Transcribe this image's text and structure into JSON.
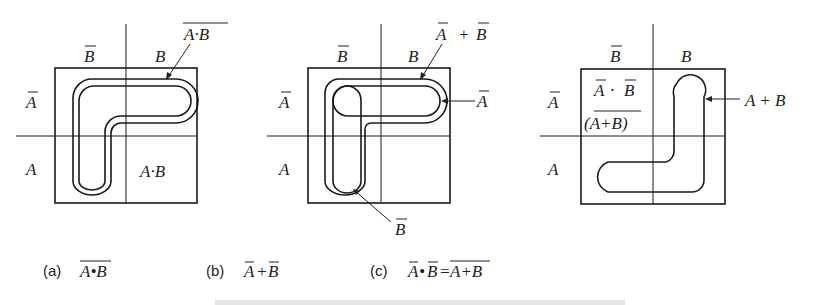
{
  "figure": {
    "panels": [
      {
        "id": "a",
        "col_labels": [
          "B̄",
          "B"
        ],
        "row_labels": [
          "Ā",
          "A"
        ],
        "cell_text": "A·B",
        "callout": "A·B (overbar)",
        "callout_text": "A·B",
        "caption_tag": "(a)",
        "caption_expr": "A•B"
      },
      {
        "id": "b",
        "col_labels": [
          "B̄",
          "B"
        ],
        "row_labels": [
          "Ā",
          "A"
        ],
        "callout_top": "Ā + B̄",
        "callout_top_a": "A",
        "callout_top_op": "+",
        "callout_top_b": "B",
        "callout_right": "A",
        "callout_bottom": "B",
        "caption_tag": "(b)",
        "caption_a": "A",
        "caption_op": "+",
        "caption_b": "B"
      },
      {
        "id": "c",
        "col_labels": [
          "B̄",
          "B"
        ],
        "row_labels": [
          "Ā",
          "A"
        ],
        "cell_line1_a": "A",
        "cell_line1_op": "·",
        "cell_line1_b": "B",
        "cell_line2": "(A+B)",
        "callout_right": "A + B",
        "caption_tag": "(c)",
        "caption_lhs_a": "A",
        "caption_lhs_op": "•",
        "caption_lhs_b": "B",
        "caption_eq": "=",
        "caption_rhs": "A+B"
      }
    ],
    "labels": {
      "Bbar": "B",
      "B": "B",
      "Abar": "A",
      "A": "A"
    }
  }
}
